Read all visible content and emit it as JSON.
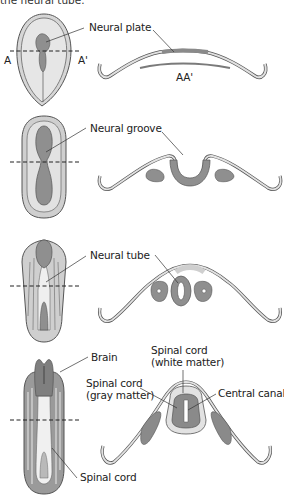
{
  "header": {
    "caption_fragment": "the neural tube."
  },
  "colors": {
    "outline": "#555555",
    "embryo_fill": "#dcdcdc",
    "embryo_light": "#ececec",
    "neural_tissue": "#8f8f8f",
    "dark_tissue": "#7a7a7a",
    "line": "#333333"
  },
  "stages": [
    {
      "name": "neural-plate-stage",
      "labels": [
        "Neural plate"
      ],
      "section_markers": {
        "left": "A",
        "right": "A'",
        "section": "AA'"
      }
    },
    {
      "name": "neural-groove-stage",
      "labels": [
        "Neural groove"
      ]
    },
    {
      "name": "neural-tube-stage",
      "labels": [
        "Neural tube"
      ]
    },
    {
      "name": "spinal-cord-stage",
      "labels": [
        "Brain",
        "Spinal cord",
        "Spinal cord",
        "(white matter)",
        "Spinal cord",
        "(gray matter)",
        "Central canal"
      ]
    }
  ]
}
